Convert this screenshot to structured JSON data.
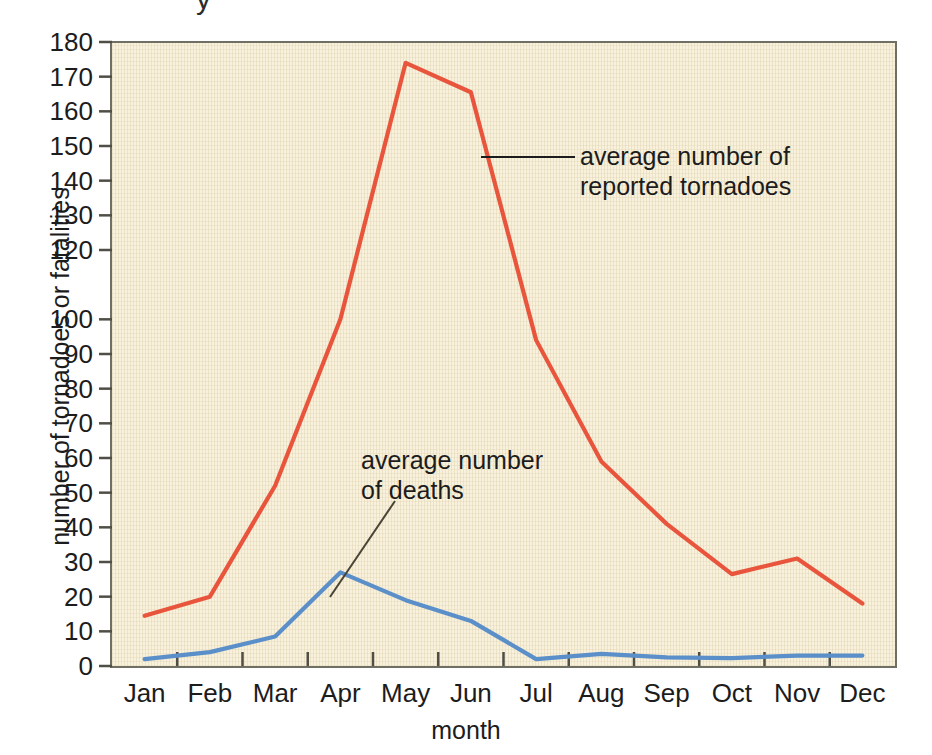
{
  "figure": {
    "title_remnant": "y",
    "background_color": "#f8f1dd",
    "frame_color": "#6f6f63"
  },
  "axes": {
    "y_title": "number of tornadoes or fatalities",
    "x_title": "month",
    "y_ticks": [
      "180",
      "170",
      "160",
      "150",
      "140",
      "130",
      "120",
      "100",
      "90",
      "80",
      "70",
      "60",
      "50",
      "40",
      "30",
      "20",
      "10",
      "0"
    ],
    "x_ticks": [
      "Jan",
      "Feb",
      "Mar",
      "Apr",
      "May",
      "Jun",
      "Jul",
      "Aug",
      "Sep",
      "Oct",
      "Nov",
      "Dec"
    ]
  },
  "annotations": {
    "tornadoes": "average number of\nreported tornadoes",
    "deaths": "average number\nof deaths"
  },
  "chart_data": {
    "type": "line",
    "title": "",
    "xlabel": "month",
    "ylabel": "number of tornadoes or fatalities",
    "categories": [
      "Jan",
      "Feb",
      "Mar",
      "Apr",
      "May",
      "Jun",
      "Jul",
      "Aug",
      "Sep",
      "Oct",
      "Nov",
      "Dec"
    ],
    "ylim": [
      0,
      180
    ],
    "xlim": [
      0,
      12
    ],
    "y_tick_values": [
      0,
      10,
      20,
      30,
      40,
      50,
      60,
      70,
      80,
      90,
      100,
      120,
      130,
      140,
      150,
      160,
      170,
      180
    ],
    "y_tick_labels_shown": [
      "0",
      "10",
      "20",
      "30",
      "40",
      "50",
      "60",
      "70",
      "80",
      "90",
      "100",
      "120",
      "130",
      "140",
      "150",
      "160",
      "170",
      "180"
    ],
    "grid": false,
    "legend": "inline-annotations",
    "series": [
      {
        "name": "average number of reported tornadoes",
        "color": "#e8553c",
        "values": [
          14.5,
          20,
          52,
          100,
          174,
          165.5,
          94,
          59,
          41,
          26.5,
          31,
          18
        ]
      },
      {
        "name": "average number of deaths",
        "color": "#5b8fc9",
        "values": [
          2,
          4,
          8.5,
          27,
          19,
          13,
          2,
          3.5,
          2.5,
          2.3,
          3,
          3
        ]
      }
    ]
  }
}
